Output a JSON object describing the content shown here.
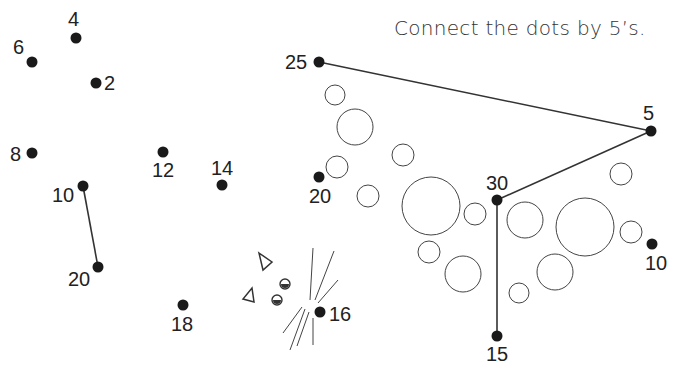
{
  "instruction": "Connect the dots by 5’s.",
  "colors": {
    "dot": "#1a1a1a",
    "line": "#333333",
    "circle": "#444444",
    "background": "#ffffff"
  },
  "left_puzzle": {
    "dots": [
      {
        "label": "2",
        "x": 96,
        "y": 83,
        "lx": 104,
        "ly": 90
      },
      {
        "label": "4",
        "x": 76,
        "y": 38,
        "lx": 68,
        "ly": 26
      },
      {
        "label": "6",
        "x": 32,
        "y": 62,
        "lx": 13,
        "ly": 54
      },
      {
        "label": "8",
        "x": 32,
        "y": 153,
        "lx": 10,
        "ly": 161
      },
      {
        "label": "10",
        "x": 83,
        "y": 186,
        "lx": 52,
        "ly": 202
      },
      {
        "label": "12",
        "x": 163,
        "y": 152,
        "lx": 152,
        "ly": 177
      },
      {
        "label": "14",
        "x": 222,
        "y": 185,
        "lx": 211,
        "ly": 175
      },
      {
        "label": "16",
        "x": 320,
        "y": 312,
        "lx": 329,
        "ly": 321
      },
      {
        "label": "18",
        "x": 183,
        "y": 305,
        "lx": 171,
        "ly": 331
      },
      {
        "label": "20",
        "x": 98,
        "y": 267,
        "lx": 68,
        "ly": 286
      }
    ],
    "lines": [
      {
        "from": "10",
        "to": "20"
      }
    ]
  },
  "right_puzzle": {
    "dots": [
      {
        "label": "5",
        "x": 651,
        "y": 131,
        "lx": 643,
        "ly": 120
      },
      {
        "label": "10",
        "x": 652,
        "y": 244,
        "lx": 645,
        "ly": 270
      },
      {
        "label": "15",
        "x": 497,
        "y": 336,
        "lx": 486,
        "ly": 361
      },
      {
        "label": "20",
        "x": 319,
        "y": 177,
        "lx": 309,
        "ly": 203
      },
      {
        "label": "25",
        "x": 319,
        "y": 62,
        "lx": 285,
        "ly": 69
      },
      {
        "label": "30",
        "x": 497,
        "y": 200,
        "lx": 486,
        "ly": 190
      }
    ],
    "lines": [
      {
        "from": "25",
        "to": "5"
      },
      {
        "from": "5",
        "to": "30"
      },
      {
        "from": "30",
        "to": "15"
      }
    ],
    "circles": [
      {
        "cx": 335,
        "cy": 95,
        "r": 10
      },
      {
        "cx": 355,
        "cy": 127,
        "r": 18
      },
      {
        "cx": 337,
        "cy": 167,
        "r": 11
      },
      {
        "cx": 403,
        "cy": 155,
        "r": 11
      },
      {
        "cx": 368,
        "cy": 196,
        "r": 11
      },
      {
        "cx": 431,
        "cy": 206,
        "r": 29
      },
      {
        "cx": 475,
        "cy": 214,
        "r": 11
      },
      {
        "cx": 429,
        "cy": 252,
        "r": 11
      },
      {
        "cx": 463,
        "cy": 274,
        "r": 18
      },
      {
        "cx": 525,
        "cy": 220,
        "r": 18
      },
      {
        "cx": 519,
        "cy": 293,
        "r": 10
      },
      {
        "cx": 555,
        "cy": 272,
        "r": 18
      },
      {
        "cx": 585,
        "cy": 227,
        "r": 29
      },
      {
        "cx": 621,
        "cy": 174,
        "r": 11
      },
      {
        "cx": 631,
        "cy": 232,
        "r": 11
      }
    ]
  },
  "decorations": {
    "triangles": [
      {
        "points": "259,253 272,262 263,270"
      },
      {
        "points": "252,288 254,302 243,299"
      }
    ],
    "eyes": [
      {
        "cx": 285,
        "cy": 284,
        "r": 5
      },
      {
        "cx": 277,
        "cy": 300,
        "r": 5
      }
    ],
    "whiskers": [
      {
        "x1": 313,
        "y1": 248,
        "x2": 310,
        "y2": 300
      },
      {
        "x1": 334,
        "y1": 251,
        "x2": 315,
        "y2": 300
      },
      {
        "x1": 338,
        "y1": 280,
        "x2": 318,
        "y2": 303
      },
      {
        "x1": 302,
        "y1": 307,
        "x2": 283,
        "y2": 333
      },
      {
        "x1": 305,
        "y1": 309,
        "x2": 290,
        "y2": 350
      },
      {
        "x1": 309,
        "y1": 312,
        "x2": 297,
        "y2": 346
      },
      {
        "x1": 313,
        "y1": 318,
        "x2": 313,
        "y2": 345
      }
    ]
  }
}
